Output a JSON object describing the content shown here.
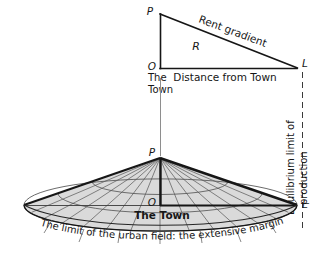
{
  "figure": {
    "background_color": "#ffffff",
    "ink_color": "#161616",
    "shade_color": "#d9d9d9",
    "thin_line_color": "#6e6e6e",
    "width": 326,
    "height": 258
  },
  "upper_diagram": {
    "name": "rent-gradient-triangle",
    "vertex_p_label": "P",
    "vertex_o_label": "O",
    "vertex_l_label": "L",
    "hypotenuse_label": "Rent gradient",
    "area_label": "R",
    "baseline_label": "Distance from Town",
    "origin_caption_line1": "The",
    "origin_caption_line2": "Town",
    "geometry": {
      "p": [
        160,
        14
      ],
      "o": [
        160,
        68
      ],
      "l": [
        297,
        68
      ]
    }
  },
  "lower_diagram": {
    "name": "urban-field-cone",
    "apex_label": "P",
    "center_label": "O",
    "rim_label": "L",
    "center_caption": "The Town",
    "base_caption": "The limit of the urban field: the extensive margin",
    "geometry": {
      "apex": [
        160,
        158
      ],
      "center": [
        160,
        205
      ],
      "rim_right": [
        297,
        205
      ],
      "rim_left": [
        24,
        205
      ],
      "ellipse_rx": 136,
      "ellipse_ry": 26
    },
    "radial_lines_count": 16,
    "concentric_rings": 3
  },
  "annotations": {
    "vertical_connector": {
      "name": "town-axis-connector",
      "from": [
        160,
        78
      ],
      "to": [
        160,
        156
      ]
    },
    "equilibrium_limit": {
      "label_line1": "Equilibrium limit of",
      "label_line2": "production",
      "full_label": "Equilibrium limit of production",
      "dashed_line_from": [
        302,
        72
      ],
      "dashed_line_to": [
        302,
        228
      ],
      "orientation": "vertical"
    }
  }
}
